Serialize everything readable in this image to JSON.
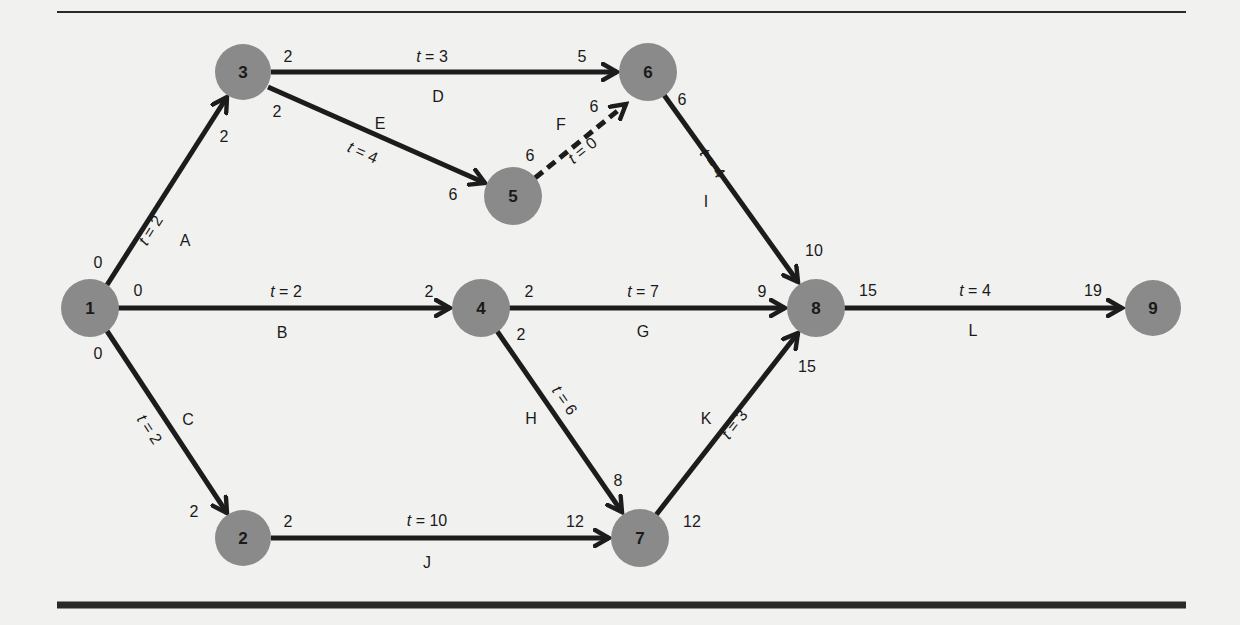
{
  "figure": {
    "type": "activity-on-arrow network diagram",
    "rules": {
      "top": {
        "x1": 57,
        "x2": 1186,
        "y": 12,
        "width": 2
      },
      "bottom": {
        "x1": 57,
        "x2": 1186,
        "y": 605,
        "width": 7
      }
    },
    "colors": {
      "background": "#f1f1f0",
      "node_fill": "#8a8a8a",
      "edge": "#1c1c1c",
      "text": "#1a1a1a"
    }
  },
  "nodes": [
    {
      "id": "1",
      "label": "1",
      "x": 90,
      "y": 308
    },
    {
      "id": "2",
      "label": "2",
      "x": 243,
      "y": 538
    },
    {
      "id": "3",
      "label": "3",
      "x": 243,
      "y": 72
    },
    {
      "id": "4",
      "label": "4",
      "x": 481,
      "y": 308
    },
    {
      "id": "5",
      "label": "5",
      "x": 513,
      "y": 196
    },
    {
      "id": "6",
      "label": "6",
      "x": 648,
      "y": 72
    },
    {
      "id": "7",
      "label": "7",
      "x": 640,
      "y": 538
    },
    {
      "id": "8",
      "label": "8",
      "x": 816,
      "y": 308
    },
    {
      "id": "9",
      "label": "9",
      "x": 1153,
      "y": 308
    }
  ],
  "activities": [
    {
      "name": "A",
      "from": "1",
      "to": "3",
      "duration_label": "t = 2",
      "duration": 2,
      "start_time": "0",
      "end_time": "2",
      "dashed": false
    },
    {
      "name": "B",
      "from": "1",
      "to": "4",
      "duration_label": "t = 2",
      "duration": 2,
      "start_time": "0",
      "end_time": "2",
      "dashed": false
    },
    {
      "name": "C",
      "from": "1",
      "to": "2",
      "duration_label": "t = 2",
      "duration": 2,
      "start_time": "0",
      "end_time": "2",
      "dashed": false
    },
    {
      "name": "D",
      "from": "3",
      "to": "6",
      "duration_label": "t = 3",
      "duration": 3,
      "start_time": "2",
      "end_time": "5",
      "dashed": false
    },
    {
      "name": "E",
      "from": "3",
      "to": "5",
      "duration_label": "t = 4",
      "duration": 4,
      "start_time": "2",
      "end_time": "6",
      "dashed": false
    },
    {
      "name": "F",
      "from": "5",
      "to": "6",
      "duration_label": "t = 0",
      "duration": 0,
      "start_time": "6",
      "end_time": "6",
      "dashed": true
    },
    {
      "name": "G",
      "from": "4",
      "to": "8",
      "duration_label": "t = 7",
      "duration": 7,
      "start_time": "2",
      "end_time": "9",
      "dashed": false
    },
    {
      "name": "H",
      "from": "4",
      "to": "7",
      "duration_label": "t = 6",
      "duration": 6,
      "start_time": "2",
      "end_time": "8",
      "dashed": false
    },
    {
      "name": "I",
      "from": "6",
      "to": "8",
      "duration_label": "t = 4",
      "duration": 4,
      "start_time": "6",
      "end_time": "10",
      "dashed": false
    },
    {
      "name": "J",
      "from": "2",
      "to": "7",
      "duration_label": "t = 10",
      "duration": 10,
      "start_time": "2",
      "end_time": "12",
      "dashed": false
    },
    {
      "name": "K",
      "from": "7",
      "to": "8",
      "duration_label": "t = 3",
      "duration": 3,
      "start_time": "12",
      "end_time": "15",
      "dashed": false
    },
    {
      "name": "L",
      "from": "8",
      "to": "9",
      "duration_label": "t = 4",
      "duration": 4,
      "start_time": "15",
      "end_time": "19",
      "dashed": false
    }
  ],
  "text": {
    "A": {
      "name": "A",
      "t": "2",
      "s": "0",
      "e": "2"
    },
    "B": {
      "name": "B",
      "t": "2",
      "s": "0",
      "e": "2"
    },
    "C": {
      "name": "C",
      "t": "2",
      "s": "0",
      "e": "2"
    },
    "D": {
      "name": "D",
      "t": "3",
      "s": "2",
      "e": "5"
    },
    "E": {
      "name": "E",
      "t": "4",
      "s": "2",
      "e": "6"
    },
    "F": {
      "name": "F",
      "t": "0",
      "s": "6",
      "e": "6"
    },
    "G": {
      "name": "G",
      "t": "7",
      "s": "2",
      "e": "9"
    },
    "H": {
      "name": "H",
      "t": "6",
      "s": "2",
      "e": "8"
    },
    "I": {
      "name": "I",
      "t": "4",
      "s": "6",
      "e": "10"
    },
    "J": {
      "name": "J",
      "t": "10",
      "s": "2",
      "e": "12"
    },
    "K": {
      "name": "K",
      "t": "3",
      "s": "12",
      "e": "15"
    },
    "L": {
      "name": "L",
      "t": "4",
      "s": "15",
      "e": "19"
    },
    "t_prefix": "t",
    "eq": " = "
  }
}
